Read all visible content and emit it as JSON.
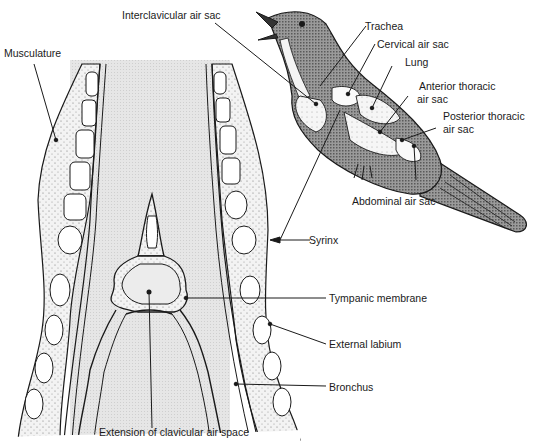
{
  "diagram": {
    "colors": {
      "ink": "#1a1a1a",
      "background": "#ffffff",
      "lumen_fill": "#e4e4e4",
      "tissue_fill": "#f0f0f0",
      "muscle_fill": "#ececec",
      "cartilage_fill": "#ffffff",
      "bird_body_fill": "#8a8a8a",
      "air_sac_fill": "#f4f4f4"
    },
    "labels": {
      "interclavicular_air_sac": "Interclavicular air sac",
      "trachea": "Trachea",
      "cervical_air_sac": "Cervical air sac",
      "lung": "Lung",
      "anterior_thoracic_line1": "Anterior thoracic",
      "anterior_thoracic_line2": "air sac",
      "posterior_thoracic_line1": "Posterior thoracic",
      "posterior_thoracic_line2": "air sac",
      "abdominal_air_sac": "Abdominal air sac",
      "musculature": "Musculature",
      "syrinx": "Syrinx",
      "tympanic_membrane": "Tympanic membrane",
      "external_labium": "External labium",
      "bronchus": "Bronchus",
      "extension_clavicular": "Extension of clavicular air space"
    }
  }
}
